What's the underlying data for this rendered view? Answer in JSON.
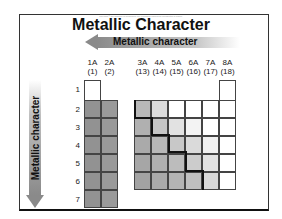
{
  "title": "Metallic Character",
  "copyright": "Copyright © The McGraw-Hill Companies, Inc. Permission required for reproduction or display.",
  "horizontal_arrow": {
    "label": "Metallic character",
    "direction": "left"
  },
  "vertical_arrow": {
    "label": "Metallic character",
    "direction": "down"
  },
  "groups": [
    {
      "label": "1A",
      "num": "(1)"
    },
    {
      "label": "2A",
      "num": "(2)"
    },
    {
      "label": "3A",
      "num": "(13)"
    },
    {
      "label": "4A",
      "num": "(14)"
    },
    {
      "label": "5A",
      "num": "(15)"
    },
    {
      "label": "6A",
      "num": "(16)"
    },
    {
      "label": "7A",
      "num": "(17)"
    },
    {
      "label": "8A",
      "num": "(18)"
    }
  ],
  "periods": [
    "1",
    "2",
    "3",
    "4",
    "5",
    "6",
    "7"
  ],
  "colors": {
    "metal_dark": "#8f8f8f",
    "metal_light": "#bdbdbd",
    "nonmetal": "#ffffff",
    "staircase": "#111111"
  }
}
